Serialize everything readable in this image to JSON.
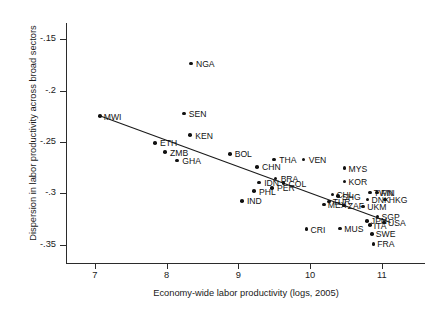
{
  "chart_data": {
    "type": "scatter",
    "title": "",
    "xlabel": "Economy-wide labor productivity (logs, 2005)",
    "ylabel": "Dispersion in labor productivity across broad sectors",
    "xlim": [
      6.6,
      11.6
    ],
    "ylim": [
      -0.368,
      -0.134
    ],
    "xticks": [
      7,
      8,
      9,
      10,
      11
    ],
    "xtick_labels": [
      "7",
      "8",
      "9",
      "10",
      "11"
    ],
    "yticks": [
      -0.15,
      -0.2,
      -0.25,
      -0.3,
      -0.35
    ],
    "ytick_labels": [
      "-.15",
      "-.2",
      "-.25",
      "-.3",
      "-.35"
    ],
    "grid": false,
    "legend": null,
    "marker_color": "#111111",
    "fit_line": {
      "label": "linear fit",
      "color": "#1a1a1a",
      "x": [
        7.07,
        11.12
      ],
      "y": [
        -0.2245,
        -0.3285
      ]
    },
    "points": [
      {
        "label": "MWI",
        "x": 7.07,
        "y": -0.2245,
        "label_dx": 4,
        "label_dy": -3
      },
      {
        "label": "NGA",
        "x": 8.34,
        "y": -0.1735,
        "label_dx": 5,
        "label_dy": -3.5
      },
      {
        "label": "SEN",
        "x": 8.24,
        "y": -0.2222,
        "label_dx": 5,
        "label_dy": -3.5
      },
      {
        "label": "ETH",
        "x": 7.84,
        "y": -0.2508,
        "label_dx": 5,
        "label_dy": -3.5
      },
      {
        "label": "KEN",
        "x": 8.33,
        "y": -0.2433,
        "label_dx": 5,
        "label_dy": -3.5
      },
      {
        "label": "ZMB",
        "x": 7.98,
        "y": -0.26,
        "label_dx": 5,
        "label_dy": -3.5
      },
      {
        "label": "GHA",
        "x": 8.15,
        "y": -0.268,
        "label_dx": 5,
        "label_dy": -3.5
      },
      {
        "label": "BOL",
        "x": 8.88,
        "y": -0.2615,
        "label_dx": 5,
        "label_dy": -3.5
      },
      {
        "label": "CHN",
        "x": 9.26,
        "y": -0.2742,
        "label_dx": 5,
        "label_dy": -3.5
      },
      {
        "label": "THA",
        "x": 9.5,
        "y": -0.2672,
        "label_dx": 5,
        "label_dy": -3.5
      },
      {
        "label": "VEN",
        "x": 9.91,
        "y": -0.2672,
        "label_dx": 5,
        "label_dy": -3.5
      },
      {
        "label": "BRA",
        "x": 9.52,
        "y": -0.2855,
        "label_dx": 5,
        "label_dy": -3.5
      },
      {
        "label": "COL",
        "x": 9.63,
        "y": -0.29,
        "label_dx": 5,
        "label_dy": -3.5
      },
      {
        "label": "IDN",
        "x": 9.29,
        "y": -0.2895,
        "label_dx": 5,
        "label_dy": -3.5
      },
      {
        "label": "PER",
        "x": 9.47,
        "y": -0.2948,
        "label_dx": 5,
        "label_dy": -3.5
      },
      {
        "label": "PHL",
        "x": 9.22,
        "y": -0.298,
        "label_dx": 5,
        "label_dy": -3.5
      },
      {
        "label": "IND",
        "x": 9.05,
        "y": -0.3075,
        "label_dx": 5,
        "label_dy": -3.5
      },
      {
        "label": "MYS",
        "x": 10.48,
        "y": -0.2755,
        "label_dx": 4,
        "label_dy": -3.5
      },
      {
        "label": "KOR",
        "x": 10.48,
        "y": -0.2885,
        "label_dx": 4,
        "label_dy": -3.5
      },
      {
        "label": "TWN",
        "x": 10.83,
        "y": -0.2992,
        "label_dx": 4,
        "label_dy": -3.5
      },
      {
        "label": "FIN",
        "x": 10.93,
        "y": -0.2992,
        "label_dx": 4,
        "label_dy": -3.5
      },
      {
        "label": "DNK",
        "x": 10.8,
        "y": -0.3062,
        "label_dx": 4,
        "label_dy": -3.5
      },
      {
        "label": "HKG",
        "x": 11.04,
        "y": -0.3062,
        "label_dx": 4,
        "label_dy": -3.5
      },
      {
        "label": "CHL",
        "x": 10.31,
        "y": -0.3012,
        "label_dx": 4,
        "label_dy": -3.5
      },
      {
        "label": "SHG",
        "x": 10.39,
        "y": -0.3028,
        "label_dx": 4,
        "label_dy": -3.5
      },
      {
        "label": "TUR",
        "x": 10.26,
        "y": -0.308,
        "label_dx": 4,
        "label_dy": -3.5
      },
      {
        "label": "MEX",
        "x": 10.19,
        "y": -0.3108,
        "label_dx": 4,
        "label_dy": -3.5
      },
      {
        "label": "ZAF",
        "x": 10.47,
        "y": -0.3118,
        "label_dx": 4,
        "label_dy": -3.5
      },
      {
        "label": "UKM",
        "x": 10.74,
        "y": -0.3128,
        "label_dx": 4,
        "label_dy": -3.5
      },
      {
        "label": "SGP",
        "x": 10.94,
        "y": -0.3225,
        "label_dx": 4,
        "label_dy": -3.5
      },
      {
        "label": "JPN",
        "x": 10.79,
        "y": -0.3268,
        "label_dx": 4,
        "label_dy": -3.5
      },
      {
        "label": "USA",
        "x": 11.03,
        "y": -0.3285,
        "label_dx": 4,
        "label_dy": -3.5
      },
      {
        "label": "ITA",
        "x": 10.83,
        "y": -0.3312,
        "label_dx": 4,
        "label_dy": -3.5
      },
      {
        "label": "MUS",
        "x": 10.42,
        "y": -0.3345,
        "label_dx": 4,
        "label_dy": -3.5
      },
      {
        "label": "CRI",
        "x": 9.95,
        "y": -0.335,
        "label_dx": 4,
        "label_dy": -3.5
      },
      {
        "label": "SWE",
        "x": 10.86,
        "y": -0.3395,
        "label_dx": 4,
        "label_dy": -3.5
      },
      {
        "label": "FRA",
        "x": 10.88,
        "y": -0.3492,
        "label_dx": 4,
        "label_dy": -3.5
      }
    ]
  }
}
